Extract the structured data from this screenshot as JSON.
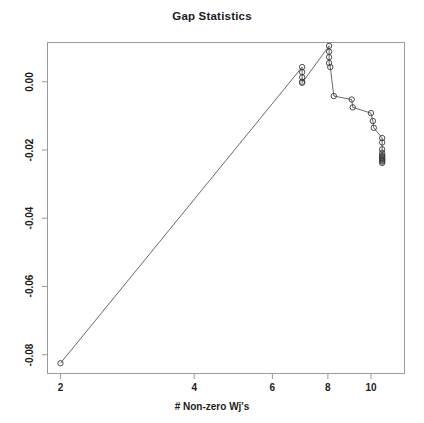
{
  "chart_data": {
    "type": "line",
    "title": "Gap Statistics",
    "xlabel": "# Non-zero Wj's",
    "ylabel": "",
    "xscale": "log",
    "xlim": [
      1.87,
      11.9
    ],
    "ylim": [
      -0.0855,
      0.0115
    ],
    "grid": false,
    "legend": "none",
    "marker": "open-circle",
    "xticks": [
      {
        "value": 2,
        "label": "2"
      },
      {
        "value": 4,
        "label": "4"
      },
      {
        "value": 6,
        "label": "6"
      },
      {
        "value": 8,
        "label": "8"
      },
      {
        "value": 10,
        "label": "10"
      }
    ],
    "yticks": [
      {
        "value": 0.0,
        "label": "0.00"
      },
      {
        "value": -0.02,
        "label": "-0.02"
      },
      {
        "value": -0.04,
        "label": "-0.04"
      },
      {
        "value": -0.06,
        "label": "-0.06"
      },
      {
        "value": -0.08,
        "label": "-0.08"
      }
    ],
    "series": [
      {
        "name": "gap",
        "x": [
          2.0,
          7.0,
          7.0,
          7.0,
          7.0,
          7.0,
          8.05,
          8.05,
          8.05,
          8.05,
          8.1,
          8.25,
          9.05,
          9.1,
          10.0,
          10.1,
          10.15,
          10.6,
          10.6,
          10.6,
          10.6,
          10.6,
          10.6,
          10.6,
          10.6,
          10.6,
          10.6,
          10.6,
          10.6
        ],
        "y": [
          -0.0825,
          0.0043,
          0.0028,
          0.0013,
          0.0,
          -0.0003,
          0.0105,
          0.0088,
          0.0072,
          0.0055,
          0.0043,
          -0.0042,
          -0.0052,
          -0.0075,
          -0.0092,
          -0.0115,
          -0.0135,
          -0.0165,
          -0.0178,
          -0.0198,
          -0.0208,
          -0.0215,
          -0.0218,
          -0.0222,
          -0.0225,
          -0.0228,
          -0.0231,
          -0.0234,
          -0.0238
        ]
      }
    ]
  },
  "colors": {
    "line": "#585858",
    "marker_stroke": "#3a3a3a",
    "axis": "#9a9a9a",
    "text": "#1c1c1c",
    "background": "#ffffff"
  }
}
